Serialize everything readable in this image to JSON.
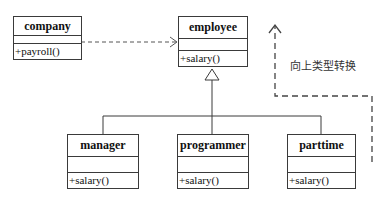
{
  "diagram": {
    "type": "UML class diagram",
    "classes": [
      {
        "name": "company",
        "attributes": "",
        "operations": "+payroll()"
      },
      {
        "name": "employee",
        "attributes": "",
        "operations": "+salary()"
      },
      {
        "name": "manager",
        "attributes": "",
        "operations": "+salary()"
      },
      {
        "name": "programmer",
        "attributes": "",
        "operations": "+salary()"
      },
      {
        "name": "parttime",
        "attributes": "",
        "operations": "+salary()"
      }
    ],
    "relations": [
      {
        "from": "company",
        "to": "employee",
        "kind": "dependency (dashed arrow)"
      },
      {
        "from": "manager",
        "to": "employee",
        "kind": "generalization"
      },
      {
        "from": "programmer",
        "to": "employee",
        "kind": "generalization"
      },
      {
        "from": "parttime",
        "to": "employee",
        "kind": "generalization"
      }
    ],
    "annotation": {
      "label": "向上类型转换",
      "kind": "dashed arrow upward"
    },
    "colors": {
      "line": "#3a3a3a",
      "dashed": "#444444",
      "text": "#111111"
    }
  }
}
